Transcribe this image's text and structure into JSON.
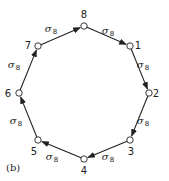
{
  "figure": {
    "panel_label": "(b)",
    "colors": {
      "stroke": "#222222",
      "node_fill": "#ffffff",
      "background": "#ffffff"
    },
    "nodes": [
      {
        "id": "1",
        "label": "1",
        "x": 130,
        "y": 46,
        "lx": 138,
        "ly": 49
      },
      {
        "id": "2",
        "label": "2",
        "x": 149,
        "y": 93,
        "lx": 156,
        "ly": 97
      },
      {
        "id": "3",
        "label": "3",
        "x": 130,
        "y": 140,
        "lx": 131,
        "ly": 155
      },
      {
        "id": "4",
        "label": "4",
        "x": 84,
        "y": 159,
        "lx": 84,
        "ly": 174
      },
      {
        "id": "5",
        "label": "5",
        "x": 38,
        "y": 140,
        "lx": 34,
        "ly": 155
      },
      {
        "id": "6",
        "label": "6",
        "x": 19,
        "y": 93,
        "lx": 8,
        "ly": 97
      },
      {
        "id": "7",
        "label": "7",
        "x": 38,
        "y": 46,
        "lx": 28,
        "ly": 49
      },
      {
        "id": "8",
        "label": "8",
        "x": 84,
        "y": 26,
        "lx": 84,
        "ly": 18
      }
    ],
    "edges": [
      {
        "from": "8",
        "to": "1",
        "label": "σ",
        "sub": "8",
        "lx": 108,
        "ly": 34
      },
      {
        "from": "1",
        "to": "2",
        "label": "σ",
        "sub": "8",
        "lx": 143,
        "ly": 68
      },
      {
        "from": "2",
        "to": "3",
        "label": "σ",
        "sub": "8",
        "lx": 143,
        "ly": 124
      },
      {
        "from": "3",
        "to": "4",
        "label": "σ",
        "sub": "8",
        "lx": 108,
        "ly": 160
      },
      {
        "from": "4",
        "to": "5",
        "label": "σ",
        "sub": "8",
        "lx": 52,
        "ly": 160
      },
      {
        "from": "5",
        "to": "6",
        "label": "σ",
        "sub": "8",
        "lx": 16,
        "ly": 124
      },
      {
        "from": "6",
        "to": "7",
        "label": "σ",
        "sub": "8",
        "lx": 14,
        "ly": 68
      },
      {
        "from": "7",
        "to": "8",
        "label": "σ",
        "sub": "8",
        "lx": 51,
        "ly": 32
      }
    ]
  }
}
